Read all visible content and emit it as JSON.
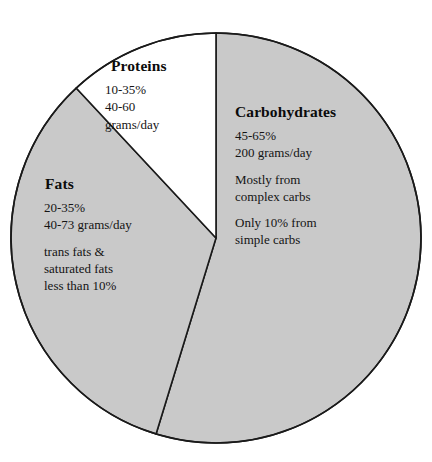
{
  "chart_data": {
    "type": "pie",
    "title": "",
    "subtitle": "",
    "xlabel": "",
    "ylabel": "",
    "legend_position": "none",
    "grid": false,
    "total_degrees": 360,
    "categories": [
      "Carbohydrates",
      "Fats",
      "Proteins"
    ],
    "values": [
      55,
      33,
      12
    ],
    "units": "percent of pie area",
    "slices": [
      {
        "name": "Carbohydrates",
        "value": 55,
        "start_deg": 0,
        "end_deg": 197,
        "fill": "#c9c9c9",
        "stroke": "#1a1a1a"
      },
      {
        "name": "Fats",
        "value": 33,
        "start_deg": 197,
        "end_deg": 317,
        "fill": "#c9c9c9",
        "stroke": "#1a1a1a"
      },
      {
        "name": "Proteins",
        "value": 12,
        "start_deg": 317,
        "end_deg": 360,
        "fill": "#ffffff",
        "stroke": "#1a1a1a"
      }
    ],
    "annotations": [
      {
        "slice": "Carbohydrates",
        "heading": "Carbohydrates",
        "lines": [
          "45-65%",
          "200 grams/day",
          "",
          "Mostly from",
          "complex carbs",
          "",
          "Only 10% from",
          "simple carbs"
        ]
      },
      {
        "slice": "Fats",
        "heading": "Fats",
        "lines": [
          "20-35%",
          "40-73 grams/day",
          "",
          "trans fats &",
          "saturated fats",
          "less than 10%"
        ]
      },
      {
        "slice": "Proteins",
        "heading": "Proteins",
        "lines": [
          "10-35%",
          "40-60",
          "grams/day"
        ]
      }
    ]
  },
  "labels": {
    "carbohydrates": {
      "heading": "Carbohydrates",
      "line1": "45-65%",
      "line2": "200 grams/day",
      "line3": "Mostly from",
      "line4": "complex carbs",
      "line5": "Only 10% from",
      "line6": "simple carbs"
    },
    "fats": {
      "heading": "Fats",
      "line1": "20-35%",
      "line2": "40-73 grams/day",
      "line3": "trans fats &",
      "line4": "saturated fats",
      "line5": "less than 10%"
    },
    "proteins": {
      "heading": "Proteins",
      "line1": "10-35%",
      "line2": "40-60",
      "line3": "grams/day"
    }
  },
  "colors": {
    "slice_gray": "#c9c9c9",
    "slice_white": "#ffffff",
    "outline": "#1a1a1a",
    "text": "#111111",
    "background": "#ffffff"
  }
}
